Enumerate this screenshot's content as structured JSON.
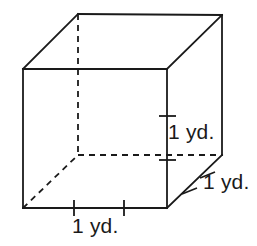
{
  "figure": {
    "name": "cube-with-dimension-labels",
    "shape": "cube",
    "background_color": "#ffffff",
    "line_color": "#1a1a1a",
    "labels": {
      "height": "1 yd.",
      "depth": "1 yd.",
      "width": "1 yd."
    },
    "geometry": {
      "front_face": {
        "top_left": [
          23,
          69
        ],
        "top_right": [
          167,
          69
        ],
        "bottom_right": [
          167,
          208
        ],
        "bottom_left": [
          23,
          208
        ]
      },
      "back_face": {
        "top_left": [
          78,
          14
        ],
        "top_right": [
          222,
          15
        ],
        "bottom_right": [
          222,
          155
        ],
        "bottom_left": [
          78,
          155
        ]
      },
      "hidden_edges": [
        "back-top-left-to-back-bottom-left",
        "back-bottom-left-to-back-bottom-right",
        "front-bottom-left-to-back-bottom-left"
      ]
    },
    "tick_marks": {
      "vertical_edge": [
        116,
        160
      ],
      "bottom_edge": [
        74,
        124
      ],
      "depth_edge": [
        190,
        208
      ]
    }
  }
}
